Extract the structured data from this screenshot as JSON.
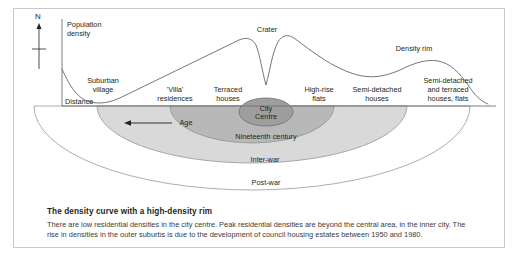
{
  "figure": {
    "axes": {
      "y_label": "Population\ndensity",
      "y_label_line1": "Population",
      "y_label_line2": "density",
      "x_label": "Distance"
    },
    "compass": {
      "label": "N",
      "icon": "north-arrow-icon"
    },
    "curve_annotations": [
      {
        "id": "suburban-village",
        "line1": "Suburban",
        "line2": "village"
      },
      {
        "id": "crater",
        "text": "Crater"
      },
      {
        "id": "density-rim",
        "text": "Density rim"
      }
    ],
    "housing_labels": [
      {
        "id": "villa-residences",
        "line1": "'Villa'",
        "line2": "residences",
        "line3": ""
      },
      {
        "id": "terraced-houses",
        "line1": "Terraced",
        "line2": "houses",
        "line3": ""
      },
      {
        "id": "high-rise-flats",
        "line1": "High-rise",
        "line2": "flats",
        "line3": ""
      },
      {
        "id": "semi-detached-houses",
        "line1": "Semi-detached",
        "line2": "houses",
        "line3": ""
      },
      {
        "id": "semi-detached-terraced",
        "line1": "Semi-detached",
        "line2": "and terraced",
        "line3": "houses, flats"
      }
    ],
    "age_arrow": {
      "label": "Age",
      "direction": "left"
    },
    "zones": [
      {
        "id": "city-centre",
        "line1": "City",
        "line2": "Centre",
        "fill": "#9c9c9c"
      },
      {
        "id": "nineteenth-century",
        "label": "Nineteenth century",
        "fill": "#b5b5b5"
      },
      {
        "id": "inter-war",
        "label": "Inter-war",
        "fill": "#d4d4d4"
      },
      {
        "id": "post-war",
        "label": "Post-war",
        "fill": "#ffffff"
      }
    ]
  },
  "caption": {
    "title": "The density curve with a high-density rim",
    "body": "There are low residential densities in the city centre. Peak residential densities are beyond the central area, in the inner city. The rise in densities in the outer suburbs is due to the development of council housing estates between 1950 and 1980."
  },
  "colors": {
    "frame": "#c9c9c9",
    "line": "#6f6f6f",
    "text": "#231f20",
    "city_centre_fill": "#9c9c9c",
    "nineteenth_fill": "#b5b5b5",
    "interwar_fill": "#d4d4d4",
    "postwar_fill": "#ffffff"
  }
}
